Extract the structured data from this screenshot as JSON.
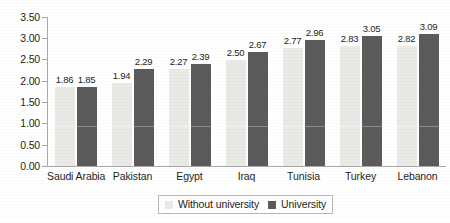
{
  "chart_data": {
    "type": "bar",
    "title": "",
    "subtitle": "",
    "xlabel": "",
    "ylabel": "",
    "categories": [
      "Saudi Arabia",
      "Pakistan",
      "Egypt",
      "Iraq",
      "Tunisia",
      "Turkey",
      "Lebanon"
    ],
    "series": [
      {
        "name": "Without university",
        "color": "#e9e9e5",
        "values": [
          1.86,
          1.94,
          2.27,
          2.5,
          2.77,
          2.83,
          2.82
        ],
        "labels": [
          "1.86",
          "1.94",
          "2.27",
          "2.50",
          "2.77",
          "2.83",
          "2.82"
        ]
      },
      {
        "name": "University",
        "color": "#5b5b5b",
        "values": [
          1.85,
          2.29,
          2.39,
          2.67,
          2.96,
          3.05,
          3.09
        ],
        "labels": [
          "1.85",
          "2.29",
          "2.39",
          "2.67",
          "2.96",
          "3.05",
          "3.09"
        ]
      }
    ],
    "ylim": [
      0.0,
      3.5
    ],
    "ytick_step": 0.5,
    "ytick_labels": [
      "3.50",
      "3.00",
      "2.50",
      "2.00",
      "1.50",
      "1.00",
      "0.50",
      "0.00"
    ],
    "ytick_values": [
      3.5,
      3.0,
      2.5,
      2.0,
      1.5,
      1.0,
      0.5,
      0.0
    ],
    "grid": false,
    "legend_position": "bottom-center",
    "data_labels_shown": true
  },
  "legend": {
    "items": [
      {
        "label": "Without university",
        "swatch": "light"
      },
      {
        "label": "University",
        "swatch": "dark"
      }
    ]
  }
}
